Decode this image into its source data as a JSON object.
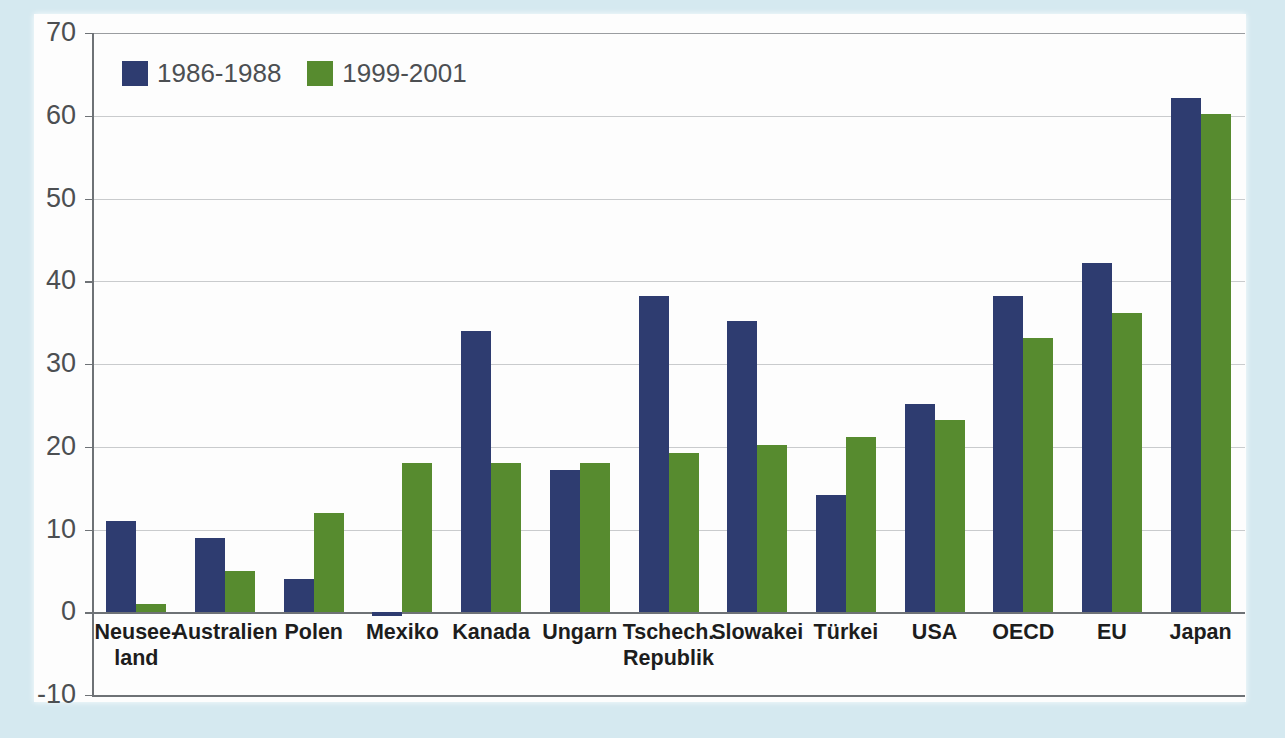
{
  "chart_data": {
    "type": "bar",
    "title": "",
    "xlabel": "",
    "ylabel": "",
    "ylim": [
      -10,
      70
    ],
    "yticks": [
      70,
      60,
      50,
      40,
      30,
      20,
      10,
      0,
      -10
    ],
    "grid": true,
    "legend_position": "top-left",
    "categories": [
      "Neusee-\nland",
      "Australien",
      "Polen",
      "Mexiko",
      "Kanada",
      "Ungarn",
      "Tschech.\nRepublik",
      "Slowakei",
      "Türkei",
      "USA",
      "OECD",
      "EU",
      "Japan"
    ],
    "category_labels": [
      {
        "line1": "Neusee-",
        "line2": "land"
      },
      {
        "line1": "Australien",
        "line2": ""
      },
      {
        "line1": "Polen",
        "line2": ""
      },
      {
        "line1": "Mexiko",
        "line2": ""
      },
      {
        "line1": "Kanada",
        "line2": ""
      },
      {
        "line1": "Ungarn",
        "line2": ""
      },
      {
        "line1": "Tschech.",
        "line2": "Republik"
      },
      {
        "line1": "Slowakei",
        "line2": ""
      },
      {
        "line1": "Türkei",
        "line2": ""
      },
      {
        "line1": "USA",
        "line2": ""
      },
      {
        "line1": "OECD",
        "line2": ""
      },
      {
        "line1": "EU",
        "line2": ""
      },
      {
        "line1": "Japan",
        "line2": ""
      }
    ],
    "series": [
      {
        "name": "1986-1988",
        "color": "#2e3c70",
        "values": [
          11.0,
          9.0,
          4.0,
          -0.5,
          34.0,
          17.2,
          38.2,
          35.2,
          14.2,
          25.2,
          38.2,
          42.2,
          62.2
        ]
      },
      {
        "name": "1999-2001",
        "color": "#578b2f",
        "values": [
          1.0,
          5.0,
          12.0,
          18.0,
          18.0,
          18.0,
          19.2,
          20.2,
          21.2,
          23.2,
          33.2,
          36.2,
          60.2
        ]
      }
    ]
  },
  "legend": {
    "items": [
      {
        "label": "1986-1988",
        "color": "#2e3c70"
      },
      {
        "label": "1999-2001",
        "color": "#578b2f"
      }
    ]
  },
  "colors": {
    "series_blue": "#2e3c70",
    "series_green": "#578b2f",
    "panel_background": "#fdfdfd",
    "figure_background": "#d5e9f0",
    "gridline": "#c9cbcd",
    "axis": "#6e7276",
    "tick_text": "#4c4f52",
    "category_text": "#1d1d1d"
  }
}
